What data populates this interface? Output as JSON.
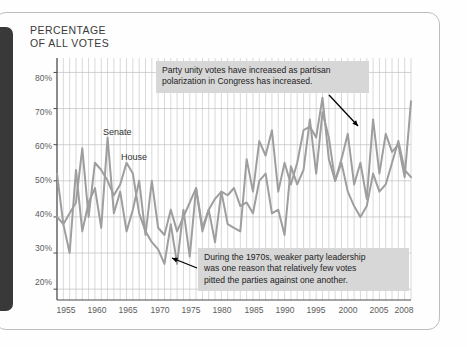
{
  "figure": {
    "title_line1": "PERCENTAGE",
    "title_line2": "OF ALL VOTES",
    "title": "PERCENTAGE\nOF ALL VOTES"
  },
  "series_labels": {
    "senate": "Senate",
    "house": "House"
  },
  "callouts": [
    {
      "id": "callout-polarization",
      "text": "Party unity votes have increased as partisan\npolarization in Congress has increased."
    },
    {
      "id": "callout-1970s",
      "text": "During the 1970s, weaker party leadership\nwas one reason that relatively few votes\npitted the parties against one another."
    }
  ],
  "colors": {
    "line": "#9e9e9e",
    "grid": "#c9c9c9",
    "grid_horizontal": "#bfbfbf",
    "axis": "#4b4b4b",
    "callout_bg": "#d7d7d7",
    "spine": "#39393a",
    "card_border": "#bdbdbd",
    "text": "#3a3a3a"
  },
  "chart_data": {
    "type": "line",
    "title": "PERCENTAGE OF ALL VOTES",
    "xlabel": "",
    "ylabel": "PERCENTAGE OF ALL VOTES",
    "xlim": [
      1953,
      2009
    ],
    "ylim": [
      17,
      84
    ],
    "ytick_values": [
      20,
      30,
      40,
      50,
      60,
      70,
      80
    ],
    "ytick_labels": [
      "20%",
      "30%",
      "40%",
      "50%",
      "60%",
      "70%",
      "80%"
    ],
    "xtick_values": [
      1955,
      1960,
      1965,
      1970,
      1975,
      1980,
      1985,
      1990,
      1995,
      2000,
      2005,
      2008
    ],
    "xtick_labels": [
      "1955",
      "1960",
      "1965",
      "1970",
      "1975",
      "1980",
      "1985",
      "1990",
      "1995",
      "2000",
      "2005",
      "2008"
    ],
    "grid": true,
    "grid_vertical_every": 1,
    "legend": "inline-labels",
    "x": [
      1953,
      1954,
      1955,
      1956,
      1957,
      1958,
      1959,
      1960,
      1961,
      1962,
      1963,
      1964,
      1965,
      1966,
      1967,
      1968,
      1969,
      1970,
      1971,
      1972,
      1973,
      1974,
      1975,
      1976,
      1977,
      1978,
      1979,
      1980,
      1981,
      1982,
      1983,
      1984,
      1985,
      1986,
      1987,
      1988,
      1989,
      1990,
      1991,
      1992,
      1993,
      1994,
      1995,
      1996,
      1997,
      1998,
      1999,
      2000,
      2001,
      2002,
      2003,
      2004,
      2005,
      2006,
      2007,
      2008,
      2009
    ],
    "series": [
      {
        "name": "Senate",
        "color": "#9e9e9e",
        "values": [
          40,
          38,
          30,
          53,
          36,
          44,
          48,
          37,
          62,
          41,
          47,
          36,
          42,
          50,
          35,
          50,
          37,
          35,
          42,
          36,
          40,
          44,
          48,
          37,
          42,
          45,
          47,
          46,
          48,
          43,
          44,
          41,
          50,
          52,
          41,
          42,
          35,
          54,
          49,
          53,
          67,
          52,
          69,
          62,
          50,
          56,
          63,
          49,
          55,
          45,
          67,
          52,
          63,
          58,
          60,
          51,
          72
        ]
      },
      {
        "name": "House",
        "color": "#9e9e9e",
        "values": [
          52,
          38,
          41,
          44,
          59,
          40,
          55,
          53,
          50,
          46,
          49,
          55,
          52,
          41,
          36,
          33,
          31,
          27,
          38,
          27,
          42,
          29,
          48,
          36,
          42,
          33,
          47,
          38,
          37,
          36,
          56,
          47,
          61,
          57,
          64,
          47,
          55,
          49,
          55,
          64,
          65,
          62,
          73,
          56,
          50,
          55,
          47,
          43,
          40,
          43,
          52,
          47,
          49,
          55,
          61,
          53,
          51
        ]
      }
    ],
    "annotations": [
      {
        "text": "Party unity votes have increased as partisan polarization in Congress has increased.",
        "points_to_year": 2003,
        "points_to_value": 67
      },
      {
        "text": "During the 1970s, weaker party leadership was one reason that relatively few votes pitted the parties against one another.",
        "points_to_year": 1972,
        "points_to_value": 27
      }
    ]
  }
}
